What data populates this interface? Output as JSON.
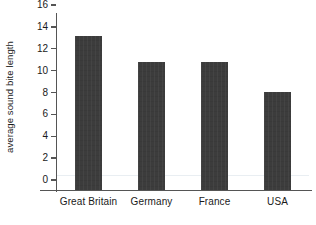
{
  "chart_data": {
    "type": "bar",
    "title": "",
    "xlabel": "",
    "ylabel": "average sound bite length",
    "categories": [
      "Great Britain",
      "Germany",
      "France",
      "USA"
    ],
    "values": [
      14.1,
      11.7,
      11.7,
      9.0
    ],
    "ylim": [
      0,
      16
    ],
    "yticks": [
      0,
      2,
      4,
      6,
      8,
      10,
      12,
      14,
      16
    ],
    "ytick_labels": [
      "0",
      "2",
      "4",
      "6",
      "8",
      "10",
      "12",
      "14",
      "16"
    ],
    "grid": "single faint horizontal line near 1.3",
    "gridline_values": [
      1.3
    ],
    "legend": null,
    "legend_position": "none",
    "bar_color": "#3c3c3c",
    "axis_color": "#555555",
    "grid_color": "#e9eef2",
    "background_color": "#ffffff",
    "axes_visible": [
      "left",
      "bottom"
    ]
  }
}
